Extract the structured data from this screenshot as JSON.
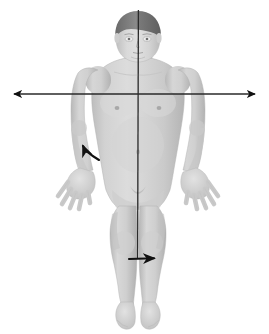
{
  "canvas": {
    "width": 269,
    "height": 334,
    "background_color": "#ffffff",
    "title": "Anatomical body with axes of motion"
  },
  "figure": {
    "pose": "anatomical-position",
    "skin_color_light": "#d8d8d8",
    "skin_color_mid": "#c4c4c4",
    "skin_color_shadow": "#a9a9a9",
    "hair_color": "#6e6e6e",
    "outline_color": "#b0b0b0"
  },
  "axes": {
    "line_color": "#2a2a2a",
    "items": [
      {
        "name": "vertical-axis",
        "label": "Vertical (longitudinal) axis",
        "orientation": "vertical",
        "x": 138,
        "y_start": 10,
        "y_end": 258,
        "has_arrowheads": false,
        "stroke_width": 1.3
      },
      {
        "name": "horizontal-axis",
        "label": "Transverse (frontal) axis",
        "orientation": "horizontal",
        "y": 94,
        "x_start": 10,
        "x_end": 259,
        "has_arrowheads": true,
        "arrowhead_ends": "both",
        "stroke_width": 1.3
      }
    ]
  },
  "arrows": {
    "color": "#111111",
    "items": [
      {
        "name": "forearm-rotation-arrow",
        "label": "Forearm supination arrow",
        "location": "left-forearm",
        "from": {
          "x": 99,
          "y": 160
        },
        "to": {
          "x": 78,
          "y": 142
        },
        "direction": "up-left",
        "curved": true
      },
      {
        "name": "leg-rotation-arrow",
        "label": "Lower leg rotation arrow",
        "location": "right-lower-leg",
        "from": {
          "x": 129,
          "y": 259
        },
        "to": {
          "x": 162,
          "y": 258
        },
        "direction": "right",
        "curved": false
      }
    ]
  },
  "legend": {
    "visible": false,
    "entries": []
  },
  "annotations": {
    "text_labels": [],
    "visible_text": ""
  }
}
